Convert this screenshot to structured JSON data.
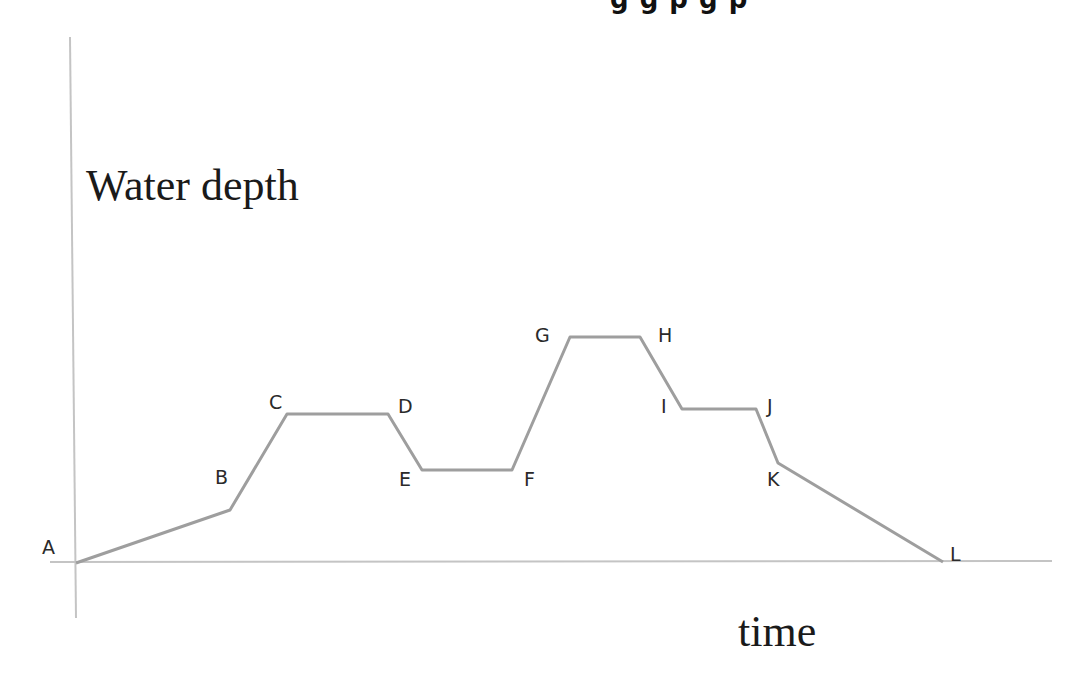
{
  "diagram": {
    "y_axis_label": "Water depth",
    "x_axis_label": "time",
    "top_cutoff_text": "g    g p  g p",
    "colors": {
      "axis": "#bdbdbd",
      "line": "#9e9e9e",
      "text": "#1a1a1a"
    },
    "points": [
      {
        "label": "A",
        "x": 76,
        "y": 563,
        "lx": 42,
        "ly": 538
      },
      {
        "label": "B",
        "x": 230,
        "y": 510,
        "lx": 215,
        "ly": 468
      },
      {
        "label": "C",
        "x": 287,
        "y": 414,
        "lx": 269,
        "ly": 393
      },
      {
        "label": "D",
        "x": 388,
        "y": 414,
        "lx": 398,
        "ly": 397
      },
      {
        "label": "E",
        "x": 422,
        "y": 470,
        "lx": 399,
        "ly": 470
      },
      {
        "label": "F",
        "x": 512,
        "y": 470,
        "lx": 524,
        "ly": 470
      },
      {
        "label": "G",
        "x": 570,
        "y": 337,
        "lx": 535,
        "ly": 326
      },
      {
        "label": "H",
        "x": 640,
        "y": 337,
        "lx": 658,
        "ly": 326
      },
      {
        "label": "I",
        "x": 682,
        "y": 409,
        "lx": 661,
        "ly": 397
      },
      {
        "label": "J",
        "x": 756,
        "y": 409,
        "lx": 767,
        "ly": 397
      },
      {
        "label": "K",
        "x": 778,
        "y": 463,
        "lx": 767,
        "ly": 470
      },
      {
        "label": "L",
        "x": 943,
        "y": 562,
        "lx": 950,
        "ly": 545
      }
    ]
  }
}
